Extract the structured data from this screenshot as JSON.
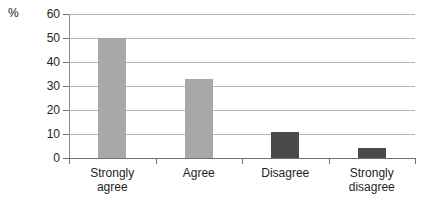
{
  "chart_data": {
    "type": "bar",
    "title": "",
    "subtitle": "",
    "xlabel": "",
    "ylabel": "%",
    "categories": [
      "Strongly agree",
      "Agree",
      "Disagree",
      "Strongly disagree"
    ],
    "values": [
      50,
      33,
      11,
      4
    ],
    "ylim": [
      0,
      60
    ],
    "ytick_labels": [
      "0",
      "10",
      "20",
      "30",
      "40",
      "50",
      "60"
    ],
    "ytick_values": [
      0,
      10,
      20,
      30,
      40,
      50,
      60
    ],
    "grid": "horizontal",
    "legend": "none",
    "bar_colors": [
      "#a8a8a8",
      "#a8a8a8",
      "#4a4a4a",
      "#4a4a4a"
    ],
    "gridline_color": "#b5b5b5",
    "axis_color": "#6f6f6f",
    "background_color": "#ffffff",
    "text_color": "#231f20"
  },
  "axis": {
    "unit_label": "%"
  },
  "category_label_lines": [
    [
      "Strongly",
      "agree"
    ],
    [
      "Agree"
    ],
    [
      "Disagree"
    ],
    [
      "Strongly",
      "disagree"
    ]
  ]
}
